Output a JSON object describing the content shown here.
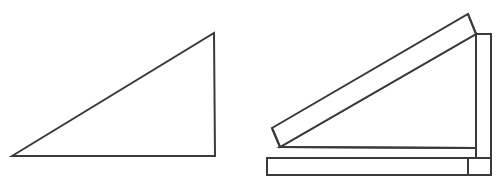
{
  "document": {
    "title": "Right triangle and corresponding 3D wedge solid",
    "background_color": "#ffffff",
    "stroke_color": "#3a3a3a",
    "fill_color": "#ffffff",
    "stroke_width": 2,
    "canvas": {
      "width": 502,
      "height": 182
    }
  },
  "figures": [
    {
      "id": "left-figure",
      "name": "flat-right-triangle",
      "label": "2D right triangle outline",
      "type": "polygon",
      "closed": true,
      "vertices": [
        {
          "name": "bottom-left-acute-vertex",
          "x": 12,
          "y": 156
        },
        {
          "name": "apex-top-right-vertex",
          "x": 214,
          "y": 33
        },
        {
          "name": "bottom-right-square-vertex",
          "x": 215,
          "y": 156
        }
      ],
      "edges": [
        {
          "name": "hypotenuse",
          "from": "bottom-left-acute-vertex",
          "to": "apex-top-right-vertex"
        },
        {
          "name": "vertical-leg",
          "from": "apex-top-right-vertex",
          "to": "bottom-right-square-vertex"
        },
        {
          "name": "horizontal-base-leg",
          "from": "bottom-right-square-vertex",
          "to": "bottom-left-acute-vertex"
        }
      ]
    },
    {
      "id": "right-figure",
      "name": "three-dimensional-wedge-solid",
      "label": "3D wedge / ramp solid drawn in oblique projection over a base slab",
      "type": "polyhedron-outline",
      "faces": [
        {
          "name": "wedge-sloped-top-face",
          "description": "Long slanted rectangular ramp surface rising from lower-left tip to upper-right",
          "points": "280,147 272,128 468,14 476,34"
        },
        {
          "name": "wedge-front-triangular-face",
          "description": "Front-facing right triangle of the ramp",
          "points": "280,147 476,34 476,148"
        },
        {
          "name": "wedge-back-right-face",
          "description": "Vertical quadrilateral face visible behind the ramp at the tall right end",
          "points": "476,34 491,34 491,158 476,158"
        },
        {
          "name": "base-slab-front-face",
          "description": "Thin rectangular plinth slab under the wedge",
          "points": "267,158 468,158 468,175 267,175"
        }
      ],
      "edges": [
        {
          "name": "ramp-top-back-edge",
          "from_x": 272,
          "from_y": 128,
          "to_x": 468,
          "to_y": 14
        },
        {
          "name": "ramp-top-front-edge",
          "from_x": 280,
          "from_y": 147,
          "to_x": 476,
          "to_y": 34
        },
        {
          "name": "ramp-left-tip-edge",
          "from_x": 272,
          "from_y": 128,
          "to_x": 280,
          "to_y": 147
        },
        {
          "name": "ramp-upper-right-bevel-edge",
          "from_x": 468,
          "from_y": 14,
          "to_x": 476,
          "to_y": 34
        },
        {
          "name": "wedge-right-vertical-edge",
          "from_x": 476,
          "from_y": 34,
          "to_x": 476,
          "to_y": 148
        },
        {
          "name": "wedge-bottom-front-edge",
          "from_x": 280,
          "from_y": 147,
          "to_x": 476,
          "to_y": 148
        },
        {
          "name": "back-face-top-edge",
          "from_x": 476,
          "from_y": 34,
          "to_x": 491,
          "to_y": 34
        },
        {
          "name": "back-face-right-vertical-edge",
          "from_x": 491,
          "from_y": 34,
          "to_x": 491,
          "to_y": 158
        },
        {
          "name": "back-face-bottom-edge",
          "from_x": 468,
          "from_y": 158,
          "to_x": 491,
          "to_y": 158
        },
        {
          "name": "slab-top-edge",
          "from_x": 267,
          "from_y": 158,
          "to_x": 491,
          "to_y": 158
        },
        {
          "name": "slab-left-vertical-edge",
          "from_x": 267,
          "from_y": 158,
          "to_x": 267,
          "to_y": 175
        },
        {
          "name": "slab-bottom-edge",
          "from_x": 267,
          "from_y": 175,
          "to_x": 468,
          "to_y": 175
        },
        {
          "name": "slab-right-vertical-edge",
          "from_x": 468,
          "from_y": 175,
          "to_x": 468,
          "to_y": 158
        }
      ]
    }
  ]
}
